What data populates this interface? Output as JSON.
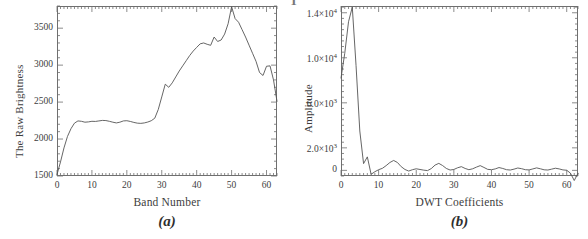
{
  "figure": {
    "top_remnant_text": "T",
    "background_color": "#ffffff",
    "line_color": "#555555",
    "axis_color": "#6f6f6f"
  },
  "panels": [
    {
      "id": "panel-a",
      "caption": "(a)",
      "xlabel": "Band Number",
      "ylabel": "The Raw Brightness",
      "ytick_labels": [
        "3500",
        "3000",
        "2500",
        "2000",
        "1500"
      ],
      "xtick_labels": [
        "0",
        "10",
        "20",
        "30",
        "40",
        "50",
        "60"
      ]
    },
    {
      "id": "panel-b",
      "caption": "(b)",
      "xlabel": "DWT Coefficients",
      "ylabel": "Amplitude",
      "ytick_labels": [
        "1.4×10⁴",
        "1.0×10⁴",
        "6.0×10³",
        "2.0×10³",
        "0"
      ],
      "xtick_labels": [
        "0",
        "10",
        "20",
        "30",
        "40",
        "50",
        "60"
      ]
    }
  ],
  "chart_data": [
    {
      "type": "line",
      "id": "raw-brightness-spectrum",
      "title": "",
      "xlabel": "Band Number",
      "ylabel": "The Raw Brightness",
      "xlim": [
        0,
        63
      ],
      "ylim": [
        1500,
        3800
      ],
      "xticks": [
        0,
        10,
        20,
        30,
        40,
        50,
        60
      ],
      "yticks": [
        1500,
        2000,
        2500,
        3000,
        3500
      ],
      "grid": false,
      "legend": "none",
      "x": [
        0,
        1,
        2,
        3,
        4,
        5,
        6,
        7,
        8,
        9,
        10,
        11,
        12,
        13,
        14,
        15,
        16,
        17,
        18,
        19,
        20,
        21,
        22,
        23,
        24,
        25,
        26,
        27,
        28,
        29,
        30,
        31,
        32,
        33,
        34,
        35,
        36,
        37,
        38,
        39,
        40,
        41,
        42,
        43,
        44,
        45,
        46,
        47,
        48,
        49,
        50,
        51,
        52,
        53,
        54,
        55,
        56,
        57,
        58,
        59,
        60,
        61,
        62,
        63
      ],
      "values": [
        1520,
        1690,
        1880,
        2035,
        2140,
        2215,
        2245,
        2240,
        2228,
        2232,
        2240,
        2238,
        2245,
        2252,
        2250,
        2240,
        2228,
        2218,
        2228,
        2245,
        2248,
        2238,
        2225,
        2215,
        2212,
        2218,
        2230,
        2248,
        2282,
        2400,
        2570,
        2742,
        2700,
        2760,
        2840,
        2920,
        2990,
        3060,
        3130,
        3190,
        3240,
        3288,
        3300,
        3282,
        3268,
        3380,
        3320,
        3340,
        3420,
        3560,
        3790,
        3630,
        3580,
        3480,
        3380,
        3270,
        3160,
        3050,
        2900,
        2860,
        2985,
        2990,
        2800,
        2510
      ]
    },
    {
      "type": "line",
      "id": "dwt-coefficients-amplitude",
      "title": "",
      "xlabel": "DWT Coefficients",
      "ylabel": "Amplitude",
      "xlim": [
        0,
        63
      ],
      "ylim": [
        -500,
        14600
      ],
      "xticks": [
        0,
        10,
        20,
        30,
        40,
        50,
        60
      ],
      "yticks": [
        0,
        2000,
        6000,
        10000,
        14000
      ],
      "ytick_display": [
        "0",
        "2.0×10³",
        "6.0×10³",
        "1.0×10⁴",
        "1.4×10⁴"
      ],
      "grid": false,
      "legend": "none",
      "x": [
        0,
        1,
        2,
        3,
        4,
        5,
        6,
        7,
        8,
        9,
        10,
        11,
        12,
        13,
        14,
        15,
        16,
        17,
        18,
        19,
        20,
        21,
        22,
        23,
        24,
        25,
        26,
        27,
        28,
        29,
        30,
        31,
        32,
        33,
        34,
        35,
        36,
        37,
        38,
        39,
        40,
        41,
        42,
        43,
        44,
        45,
        46,
        47,
        48,
        49,
        50,
        51,
        52,
        53,
        54,
        55,
        56,
        57,
        58,
        59,
        60,
        61,
        62,
        63
      ],
      "values": [
        8200,
        10400,
        13200,
        14500,
        9300,
        3500,
        600,
        1200,
        -350,
        -120,
        60,
        180,
        420,
        700,
        880,
        700,
        330,
        80,
        -60,
        60,
        140,
        80,
        20,
        -20,
        160,
        470,
        620,
        430,
        170,
        30,
        80,
        230,
        330,
        170,
        60,
        140,
        290,
        420,
        260,
        90,
        60,
        130,
        250,
        170,
        60,
        30,
        110,
        210,
        150,
        60,
        40,
        130,
        220,
        140,
        50,
        30,
        110,
        190,
        130,
        40,
        10,
        -250,
        -900,
        -260
      ]
    }
  ]
}
